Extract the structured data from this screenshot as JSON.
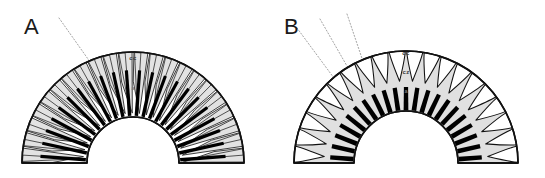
{
  "figure": {
    "width": 545,
    "height": 178,
    "background": "#ffffff"
  },
  "colors": {
    "outline": "#111111",
    "wedge_fill": "#e2e2e2",
    "body_fill": "#e0e0e0",
    "bar_fill": "#000000",
    "petal_fill": "#ffffff",
    "leader_line": "#999999",
    "label_text": "#3a3a3a",
    "panel_letter": "#1a1a1a",
    "background": "#ffffff"
  },
  "panels": [
    {
      "id": "A",
      "letter": "A",
      "letter_x": 24,
      "letter_y": 34,
      "center_x": 133,
      "center_y": 163,
      "outer_radius": 111,
      "inner_radius": 46,
      "segment_count": 22,
      "labels": [
        {
          "id": "cc",
          "text": "cc",
          "x": 133,
          "y": 60,
          "style": "struct-label"
        },
        {
          "id": "inner",
          "text": "a",
          "x": 133,
          "y": 90,
          "style": "struct-label-faint"
        }
      ],
      "leaders": [
        {
          "id": "leader-1",
          "x1": 59,
          "y1": 18,
          "x2": 112,
          "y2": 93
        }
      ]
    },
    {
      "id": "B",
      "letter": "B",
      "letter_x": 284,
      "letter_y": 34,
      "center_x": 406,
      "center_y": 163,
      "outer_radius": 112,
      "inner_radius": 52,
      "petal_count": 20,
      "bar_count": 21,
      "labels": [
        {
          "id": "cc",
          "text": "cc",
          "x": 406,
          "y": 55,
          "style": "struct-label"
        },
        {
          "id": "cz",
          "text": "cz",
          "x": 406,
          "y": 74,
          "style": "struct-label"
        },
        {
          "id": "inner",
          "text": "a",
          "x": 406,
          "y": 93,
          "style": "struct-label-faint"
        }
      ],
      "leaders": [
        {
          "id": "leader-1",
          "x1": 297,
          "y1": 28,
          "x2": 345,
          "y2": 93
        },
        {
          "id": "leader-2",
          "x1": 320,
          "y1": 19,
          "x2": 355,
          "y2": 80
        },
        {
          "id": "leader-3",
          "x1": 347,
          "y1": 14,
          "x2": 372,
          "y2": 88
        }
      ]
    }
  ]
}
